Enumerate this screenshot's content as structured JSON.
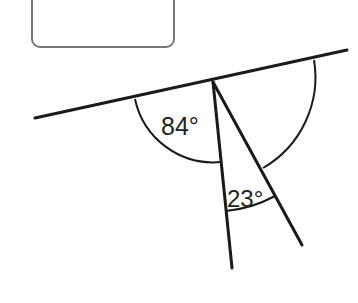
{
  "diagram": {
    "type": "geometry-angles",
    "answer_box": {
      "x": 32,
      "y": -10,
      "width": 142,
      "height": 57,
      "rx": 8,
      "stroke": "#777777",
      "content": ""
    },
    "vertex": {
      "x": 213,
      "y": 82
    },
    "straight_line": {
      "x1": 35,
      "y1": 118,
      "x2": 347,
      "y2": 50
    },
    "ray_a": {
      "x1": 213,
      "y1": 82,
      "x2": 232,
      "y2": 268
    },
    "ray_b": {
      "x1": 213,
      "y1": 82,
      "x2": 302,
      "y2": 245
    },
    "angles": [
      {
        "id": "left",
        "label": "84°",
        "known": true
      },
      {
        "id": "middle",
        "label": "23°",
        "known": true
      },
      {
        "id": "right",
        "label": "",
        "known": false
      }
    ],
    "line_color": "#1a1a1a"
  }
}
